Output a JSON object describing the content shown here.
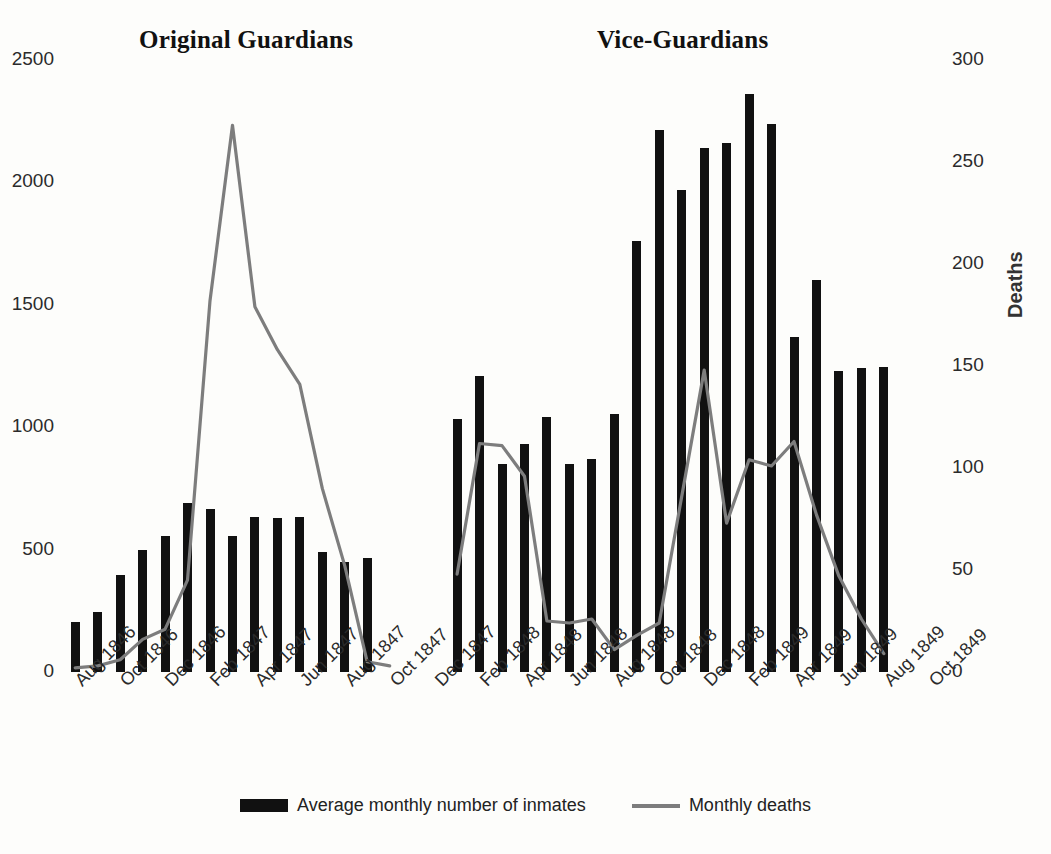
{
  "sections": {
    "left_title": "Original Guardians",
    "right_title": "Vice-Guardians"
  },
  "legend": {
    "bars_label": "Average monthly number of inmates",
    "line_label": "Monthly deaths"
  },
  "axes": {
    "left_ticks": [
      "0",
      "500",
      "1000",
      "1500",
      "2000",
      "2500"
    ],
    "right_ticks": [
      "0",
      "50",
      "100",
      "150",
      "200",
      "250",
      "300"
    ],
    "right_title": "Deaths",
    "left_max": 2500,
    "right_max": 300
  },
  "colors": {
    "bar": "#111111",
    "line": "#7d7d7d",
    "background": "#fdfdfb",
    "text": "#1a1a1a"
  },
  "chart_data": {
    "type": "bar",
    "title": "",
    "subtitle": "",
    "xlabel": "",
    "ylabel": "",
    "y2label": "Deaths",
    "ylim": [
      0,
      2500
    ],
    "y2lim": [
      0,
      300
    ],
    "grid": false,
    "legend_position": "bottom",
    "x_tick_labels": [
      "Aug 1846",
      "Oct 1846",
      "Dec 1846",
      "Feb 1847",
      "Apr 1847",
      "Jun 1847",
      "Aug 1847",
      "Oct 1847",
      "Dec 1847",
      "Feb 1848",
      "Apr 1848",
      "Jun 1848",
      "Aug 1848",
      "Oct 1848",
      "Dec 1848",
      "Feb 1849",
      "Apr 1849",
      "Jun 1849",
      "Aug 1849",
      "Oct 1849"
    ],
    "x_tick_indices": [
      0,
      2,
      4,
      6,
      8,
      10,
      12,
      14,
      16,
      18,
      20,
      22,
      24,
      26,
      28,
      30,
      32,
      34,
      36,
      38
    ],
    "categories": [
      "Aug 1846",
      "Sep 1846",
      "Oct 1846",
      "Nov 1846",
      "Dec 1846",
      "Jan 1847",
      "Feb 1847",
      "Mar 1847",
      "Apr 1847",
      "May 1847",
      "Jun 1847",
      "Jul 1847",
      "Aug 1847",
      "Sep 1847",
      "Oct 1847",
      "Nov 1847",
      "Dec 1847",
      "Jan 1848",
      "Feb 1848",
      "Mar 1848",
      "Apr 1848",
      "May 1848",
      "Jun 1848",
      "Jul 1848",
      "Aug 1848",
      "Sep 1848",
      "Oct 1848",
      "Nov 1848",
      "Dec 1848",
      "Jan 1849",
      "Feb 1849",
      "Mar 1849",
      "Apr 1849",
      "May 1849",
      "Jun 1849",
      "Jul 1849",
      "Aug 1849",
      "Sep 1849",
      "Oct 1849"
    ],
    "series": [
      {
        "name": "Average monthly number of inmates",
        "type": "bar",
        "axis": "left",
        "values": [
          205,
          245,
          395,
          500,
          555,
          690,
          665,
          555,
          635,
          630,
          635,
          490,
          450,
          465,
          null,
          null,
          null,
          1035,
          1210,
          850,
          930,
          1040,
          850,
          870,
          1055,
          1760,
          2215,
          1970,
          2140,
          2160,
          2360,
          2240,
          1370,
          1600,
          1230,
          1240,
          1245,
          null,
          null
        ]
      },
      {
        "name": "Monthly deaths",
        "type": "line",
        "axis": "right",
        "values": [
          2,
          3,
          6,
          16,
          21,
          45,
          182,
          268,
          179,
          158,
          141,
          90,
          52,
          5,
          3,
          null,
          null,
          48,
          112,
          111,
          96,
          25,
          24,
          26,
          11,
          18,
          24,
          86,
          148,
          73,
          104,
          101,
          113,
          77,
          47,
          26,
          9,
          null,
          null
        ]
      }
    ]
  }
}
